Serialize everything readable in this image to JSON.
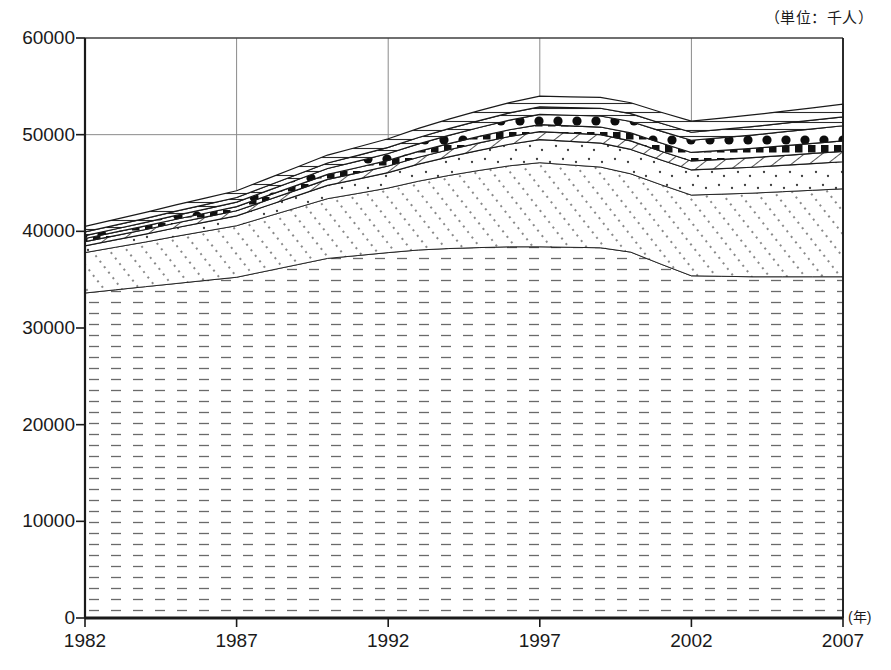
{
  "chart_data": {
    "type": "area",
    "stacked": true,
    "title": "",
    "subtitle": "",
    "unit_note": "（単位：千人）",
    "xlabel": "(年)",
    "ylabel": "",
    "grid": true,
    "legend_position": "none",
    "xlim": [
      1982,
      2007
    ],
    "ylim": [
      0,
      60000
    ],
    "ytick_step": 10000,
    "yticks": [
      "0",
      "10000",
      "20000",
      "30000",
      "40000",
      "50000",
      "60000"
    ],
    "xticks": [
      "1982",
      "1987",
      "1992",
      "1997",
      "2002",
      "2007"
    ],
    "x": [
      1982,
      1983,
      1984,
      1985,
      1986,
      1987,
      1988,
      1989,
      1990,
      1991,
      1992,
      1993,
      1994,
      1995,
      1996,
      1997,
      1998,
      1999,
      2000,
      2001,
      2002,
      2003,
      2004,
      2005,
      2006,
      2007
    ],
    "series": [
      {
        "name": "layer-1-horizontal-dash",
        "pattern": "horizontal-dashes",
        "values": [
          33620,
          33950,
          34280,
          34600,
          34930,
          35250,
          35900,
          36550,
          37200,
          37500,
          37800,
          38070,
          38220,
          38320,
          38400,
          38400,
          38350,
          38300,
          37850,
          36600,
          35400,
          35350,
          35300,
          35300,
          35300,
          35300
        ]
      },
      {
        "name": "layer-2-diagonal-dotted",
        "pattern": "diagonal-dotted",
        "values": [
          4180,
          4400,
          4620,
          4880,
          5100,
          5330,
          5620,
          5900,
          6180,
          6420,
          6680,
          7120,
          7560,
          7980,
          8380,
          8700,
          8520,
          8350,
          8100,
          8220,
          8350,
          8500,
          8650,
          8800,
          8950,
          9100
        ]
      },
      {
        "name": "layer-3-sparse-dots",
        "pattern": "sparse-dots",
        "values": [
          700,
          760,
          820,
          890,
          950,
          1020,
          1130,
          1250,
          1370,
          1480,
          1600,
          1760,
          1920,
          2080,
          2230,
          2380,
          2430,
          2480,
          2520,
          2560,
          2600,
          2640,
          2680,
          2720,
          2760,
          2800
        ]
      },
      {
        "name": "layer-4-diagonal-hatch",
        "pattern": "diagonal-hatch",
        "values": [
          430,
          450,
          470,
          490,
          510,
          530,
          560,
          590,
          620,
          650,
          680,
          710,
          740,
          770,
          800,
          830,
          850,
          870,
          890,
          910,
          930,
          960,
          990,
          1020,
          1050,
          1080
        ]
      },
      {
        "name": "layer-5-small-squares",
        "pattern": "small-squares",
        "values": [
          330,
          350,
          370,
          390,
          410,
          430,
          460,
          490,
          520,
          550,
          580,
          610,
          640,
          670,
          700,
          730,
          760,
          790,
          820,
          850,
          880,
          920,
          960,
          1000,
          1040,
          1080
        ]
      },
      {
        "name": "layer-6-large-dots",
        "pattern": "large-dots",
        "values": [
          300,
          330,
          360,
          400,
          430,
          460,
          510,
          560,
          610,
          660,
          710,
          780,
          850,
          920,
          990,
          1060,
          1100,
          1140,
          1180,
          1220,
          1260,
          1320,
          1380,
          1440,
          1500,
          1560
        ]
      },
      {
        "name": "layer-7-thin-lines",
        "pattern": "thin-horizontal-lines",
        "values": [
          380,
          400,
          420,
          440,
          460,
          480,
          510,
          540,
          570,
          600,
          630,
          660,
          690,
          720,
          750,
          780,
          790,
          800,
          810,
          820,
          830,
          850,
          870,
          890,
          910,
          930
        ]
      },
      {
        "name": "layer-8-top-band",
        "pattern": "thin-horizontal-lines-outer",
        "values": [
          580,
          600,
          620,
          650,
          670,
          700,
          740,
          780,
          820,
          860,
          900,
          940,
          980,
          1020,
          1060,
          1100,
          1110,
          1120,
          1130,
          1140,
          1150,
          1180,
          1210,
          1240,
          1270,
          1300
        ]
      }
    ],
    "totals": [
      40520,
      41240,
      41960,
      42740,
      43460,
      44200,
      45430,
      46660,
      47890,
      48720,
      49580,
      50650,
      51600,
      52480,
      53310,
      53980,
      53860,
      53750,
      53300,
      52320,
      51400,
      51720,
      52040,
      52410,
      52780,
      53150
    ],
    "colors": {
      "axis": "#1a1a1a",
      "grid": "#8a8a8a",
      "ink": "#1a1a1a",
      "fill": "#ffffff"
    }
  }
}
